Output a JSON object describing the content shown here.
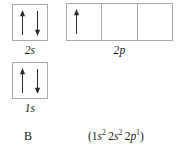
{
  "diagram": {
    "type": "orbital-filling-diagram",
    "element_symbol": "B",
    "electron_configuration": {
      "open_paren": "(",
      "close_paren": ")",
      "groups": [
        {
          "shell": "1",
          "subshell": "s",
          "electrons": "2"
        },
        {
          "shell": "2",
          "subshell": "s",
          "electrons": "2"
        },
        {
          "shell": "2",
          "subshell": "p",
          "electrons": "1"
        }
      ]
    },
    "orbitals": [
      {
        "id": "2s",
        "label": "2s",
        "boxes": 1,
        "electrons": [
          {
            "box": 0,
            "spins": [
              "up",
              "down"
            ]
          }
        ]
      },
      {
        "id": "2p",
        "label": "2p",
        "boxes": 3,
        "electrons": [
          {
            "box": 0,
            "spins": [
              "up"
            ]
          },
          {
            "box": 1,
            "spins": []
          },
          {
            "box": 2,
            "spins": []
          }
        ]
      },
      {
        "id": "1s",
        "label": "1s",
        "boxes": 1,
        "electrons": [
          {
            "box": 0,
            "spins": [
              "up",
              "down"
            ]
          }
        ]
      }
    ],
    "colors": {
      "box_border": "#a8a8a8",
      "arrow": "#2b2b2b",
      "text": "#1a1a1a",
      "background": "#ffffff"
    }
  }
}
